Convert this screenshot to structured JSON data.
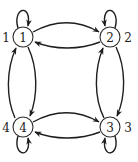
{
  "diagram": {
    "type": "directed-graph",
    "colors": {
      "stroke": "#1e1e1e",
      "background": "#ffffff"
    },
    "nodes": [
      {
        "id": "1",
        "label": "1",
        "outer_label": "1"
      },
      {
        "id": "2",
        "label": "2",
        "outer_label": "2"
      },
      {
        "id": "3",
        "label": "3",
        "outer_label": "3"
      },
      {
        "id": "4",
        "label": "4",
        "outer_label": "4"
      }
    ],
    "edges": [
      {
        "from": "1",
        "to": "1"
      },
      {
        "from": "2",
        "to": "2"
      },
      {
        "from": "3",
        "to": "3"
      },
      {
        "from": "4",
        "to": "4"
      },
      {
        "from": "1",
        "to": "2"
      },
      {
        "from": "2",
        "to": "1"
      },
      {
        "from": "4",
        "to": "3"
      },
      {
        "from": "3",
        "to": "4"
      },
      {
        "from": "1",
        "to": "4"
      },
      {
        "from": "4",
        "to": "1"
      },
      {
        "from": "2",
        "to": "3"
      },
      {
        "from": "3",
        "to": "2"
      }
    ]
  }
}
